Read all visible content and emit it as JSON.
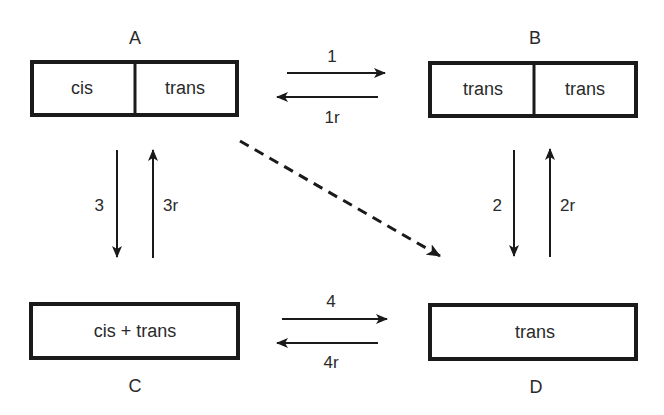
{
  "diagram": {
    "nodes": {
      "A": {
        "label": "A",
        "cells": [
          "cis",
          "trans"
        ]
      },
      "B": {
        "label": "B",
        "cells": [
          "trans",
          "trans"
        ]
      },
      "C": {
        "label": "C",
        "cells": [
          "cis + trans"
        ]
      },
      "D": {
        "label": "D",
        "cells": [
          "trans"
        ]
      }
    },
    "edges": [
      {
        "id": "1",
        "label": "1",
        "from": "A",
        "to": "B",
        "style": "solid"
      },
      {
        "id": "1r",
        "label": "1r",
        "from": "B",
        "to": "A",
        "style": "solid"
      },
      {
        "id": "2",
        "label": "2",
        "from": "B",
        "to": "D",
        "style": "solid"
      },
      {
        "id": "2r",
        "label": "2r",
        "from": "D",
        "to": "B",
        "style": "solid"
      },
      {
        "id": "3",
        "label": "3",
        "from": "A",
        "to": "C",
        "style": "solid"
      },
      {
        "id": "3r",
        "label": "3r",
        "from": "C",
        "to": "A",
        "style": "solid"
      },
      {
        "id": "4",
        "label": "4",
        "from": "C",
        "to": "D",
        "style": "solid"
      },
      {
        "id": "4r",
        "label": "4r",
        "from": "D",
        "to": "C",
        "style": "solid"
      },
      {
        "id": "AD",
        "label": "",
        "from": "A",
        "to": "D",
        "style": "dashed"
      }
    ],
    "colors": {
      "stroke": "#1a1a1a",
      "text": "#2a2a2a",
      "background": "#ffffff"
    }
  }
}
